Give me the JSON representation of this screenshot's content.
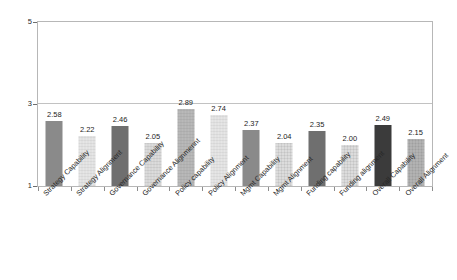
{
  "chart_data": {
    "type": "bar",
    "title": "",
    "subtitle": "",
    "xlabel": "",
    "ylabel": "",
    "ylim": [
      1,
      5
    ],
    "ytick_labels": [
      "1",
      "3",
      "5"
    ],
    "ytick_values": [
      1,
      3,
      5
    ],
    "grid": "horizontal gridline at y=3 only",
    "legend": "none",
    "orientation": "vertical",
    "bar_value_labels": true,
    "xtick_label_rotation": -45,
    "categories": [
      "Strategy Capability",
      "Strategy Alignment",
      "Governance Capability",
      "Governance Alignmennt",
      "Policy capability",
      "Policy Alignment",
      "Mgmt Capability",
      "Mgmt Alignment",
      "Funding capability",
      "Funding alignment",
      "Overall Capability",
      "Overall Alignment"
    ],
    "values": [
      2.58,
      2.22,
      2.46,
      2.05,
      2.89,
      2.74,
      2.37,
      2.04,
      2.35,
      2.0,
      2.49,
      2.15
    ],
    "value_labels": [
      "2.58",
      "2.22",
      "2.46",
      "2.05",
      "2.89",
      "2.74",
      "2.37",
      "2.04",
      "2.35",
      "2.00",
      "2.49",
      "2.15"
    ],
    "bar_fills": [
      "dkgray",
      "vlight",
      "darker",
      "light",
      "medgray",
      "vlight",
      "dkgray",
      "light",
      "darker",
      "light",
      "black",
      "midtex"
    ],
    "colors": {
      "bar_dkgray": "#8a8a8a",
      "bar_darker": "#6f6f6f",
      "bar_black": "#3b3b3b",
      "bar_medgray": "#b9b9b9",
      "bar_light": "#dcdcdc",
      "bar_vlight": "#e6e6e6",
      "bar_midtex": "#a9a9a9",
      "frame": "#b7b7b7",
      "gridline": "#c2c2c2",
      "text": "#1d1d1d",
      "background": "#ffffff"
    }
  }
}
